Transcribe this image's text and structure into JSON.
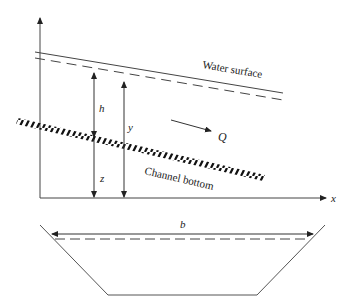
{
  "diagram": {
    "labels": {
      "water_surface": "Water surface",
      "channel_bottom": "Channel bottom",
      "flow": "Q",
      "depth_h": "h",
      "depth_y": "y",
      "elevation_z": "z",
      "x_axis": "x",
      "top_width": "b"
    },
    "colors": {
      "line": "#333333",
      "hatch": "#111111",
      "background": "#ffffff"
    }
  }
}
